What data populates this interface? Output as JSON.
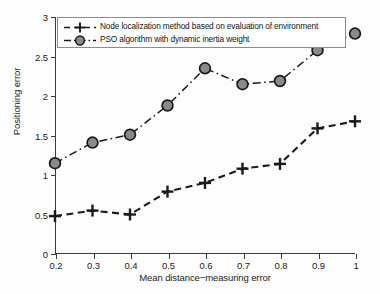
{
  "chart_data": {
    "type": "line",
    "title": "",
    "xlabel": "Mean distance−measuring error",
    "ylabel": "Positioning error",
    "x": [
      0.2,
      0.3,
      0.4,
      0.5,
      0.6,
      0.7,
      0.8,
      0.9,
      1.0
    ],
    "xlim": [
      0.2,
      1.0
    ],
    "ylim": [
      0,
      3
    ],
    "xticks": [
      "0.2",
      "0.3",
      "0.4",
      "0.5",
      "0.6",
      "0.7",
      "0.8",
      "0.9",
      "1"
    ],
    "yticks": [
      "0",
      "0.5",
      "1",
      "1.5",
      "2",
      "2.5",
      "3"
    ],
    "grid": false,
    "legend_position": "top-center",
    "series": [
      {
        "name": "Node localization method based on evaluation of environment",
        "values": [
          0.48,
          0.55,
          0.5,
          0.79,
          0.9,
          1.08,
          1.14,
          1.59,
          1.68
        ],
        "color": "#1a1a1a",
        "marker": "plus",
        "linestyle": "dashed"
      },
      {
        "name": "PSO algorithm with dynamic inertia weight",
        "values": [
          1.15,
          1.41,
          1.51,
          1.88,
          2.35,
          2.15,
          2.19,
          2.58,
          2.79
        ],
        "color": "#8a8a8a",
        "edgecolor": "#1a1a1a",
        "marker": "circle",
        "linestyle": "dashdot"
      }
    ]
  },
  "legend": {
    "items": [
      {
        "label": "Node localization method based on evaluation of environment"
      },
      {
        "label": "PSO algorithm with dynamic inertia weight"
      }
    ]
  }
}
